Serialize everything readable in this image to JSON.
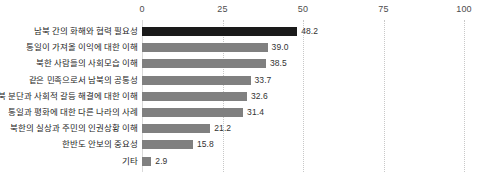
{
  "chart_data": {
    "type": "bar",
    "orientation": "horizontal",
    "title": "",
    "subtitle": "",
    "xlabel": "",
    "ylabel": "",
    "xlim": [
      0,
      100
    ],
    "grid": true,
    "legend": "none",
    "axis_ticks": [
      "0",
      "25",
      "50",
      "75",
      "100"
    ],
    "axis_tick_values": [
      0,
      25,
      50,
      75,
      100
    ],
    "categories": [
      "남북 간의 화해와 협력 필요성",
      "통일이 가져올 이익에 대한 이해",
      "북한 사람들의 사회모습 이해",
      "같은 민족으로서 남북의 공통성",
      "남북 분단과 사회적 갈등 해결에 대한 이해",
      "통일과 평화에 대한 다른 나라의 사례",
      "북한의 실상과 주민의 인권상황 이해",
      "한반도 안보의 중요성",
      "기타"
    ],
    "values": [
      48.2,
      39.0,
      38.5,
      33.7,
      32.6,
      31.4,
      21.2,
      15.8,
      2.9
    ],
    "value_labels": [
      "48.2",
      "39.0",
      "38.5",
      "33.7",
      "32.6",
      "31.4",
      "21.2",
      "15.8",
      "2.9"
    ],
    "colors": {
      "bar_default": "#808080",
      "bar_highlight": "#1a1a1a",
      "gridline": "#c8c8c8",
      "text": "#262626"
    },
    "highlight_index": 0
  }
}
